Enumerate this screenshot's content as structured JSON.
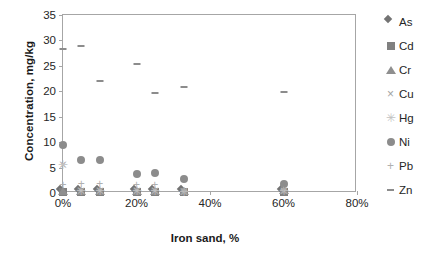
{
  "chart_data": {
    "type": "scatter",
    "title": "",
    "xlabel": "Iron sand, %",
    "ylabel": "Concentration, mg/kg",
    "xlim": [
      0,
      80
    ],
    "ylim": [
      0,
      35
    ],
    "xticks": [
      0,
      20,
      40,
      60,
      80
    ],
    "xticklabels": [
      "0%",
      "20%",
      "40%",
      "60%",
      "80%"
    ],
    "yticks": [
      0,
      5,
      10,
      15,
      20,
      25,
      30,
      35
    ],
    "yticklabels": [
      "0",
      "5",
      "10",
      "15",
      "20",
      "25",
      "30",
      "35"
    ],
    "grid": false,
    "legend_position": "right",
    "x": [
      0,
      5,
      10,
      20,
      25,
      33,
      60
    ],
    "series": [
      {
        "name": "As",
        "marker": "diamond",
        "color": "#737373",
        "values": [
          0.2,
          0.2,
          0.2,
          0.2,
          0.2,
          0.2,
          0.2
        ]
      },
      {
        "name": "Cd",
        "marker": "square",
        "color": "#808080",
        "values": [
          0.1,
          0.1,
          0.1,
          0.1,
          0.1,
          0.1,
          0.1
        ]
      },
      {
        "name": "Cr",
        "marker": "triangle",
        "color": "#8f8f8f",
        "values": [
          0.3,
          0.3,
          0.3,
          0.3,
          0.3,
          0.3,
          0.5
        ]
      },
      {
        "name": "Cu",
        "marker": "cross",
        "color": "#a3a3a3",
        "values": [
          5.5,
          0.4,
          0.4,
          0.4,
          0.4,
          0.3,
          0.4
        ]
      },
      {
        "name": "Hg",
        "marker": "star",
        "color": "#c2c2c2",
        "values": [
          5.5,
          0.3,
          0.3,
          0.3,
          0.3,
          0.2,
          0.3
        ]
      },
      {
        "name": "Ni",
        "marker": "circle",
        "color": "#8c8c8c",
        "values": [
          9.5,
          6.4,
          6.4,
          3.8,
          3.9,
          2.7,
          1.7
        ]
      },
      {
        "name": "Pb",
        "marker": "plus",
        "color": "#b0b0b0",
        "values": [
          1.5,
          1.7,
          1.7,
          1.5,
          1.6,
          0.3,
          0.6
        ]
      },
      {
        "name": "Zn",
        "marker": "dash",
        "color": "#8c8c8c",
        "values": [
          28.4,
          29.0,
          22.0,
          25.3,
          19.6,
          20.8,
          19.9
        ]
      }
    ]
  }
}
